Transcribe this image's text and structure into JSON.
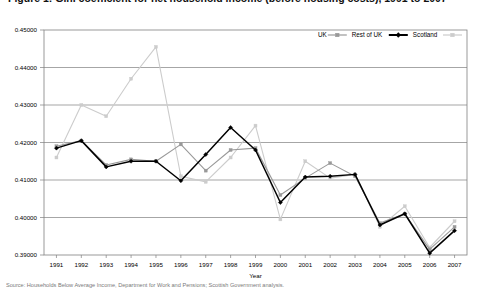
{
  "title": {
    "text": "Figure 1: Gini coefficient for net household income (before housing costs), 1991 to 2007",
    "cut_off": true
  },
  "footnote": {
    "text": "Source: Households Below Average Income, Department for Work and Pensions; Scottish Government analysis."
  },
  "legend": {
    "position": "top-right",
    "entries": [
      {
        "label": "UK",
        "color": "#999999",
        "marker": "square"
      },
      {
        "label": "Rest of UK",
        "color": "#000000",
        "marker": "diamond"
      },
      {
        "label": "Scotland",
        "color": "#cccccc",
        "marker": "square"
      }
    ]
  },
  "axes": {
    "xlabel": "Year",
    "ylabel": "",
    "ylim": [
      0.39,
      0.45
    ],
    "ytick_labels": [
      "0.45000",
      "0.44000",
      "0.43000",
      "0.42000",
      "0.41000",
      "0.40000",
      "0.39000"
    ],
    "ytick_values": [
      0.45,
      0.44,
      0.43,
      0.42,
      0.41,
      0.4,
      0.39
    ],
    "grid": true
  },
  "chart_data": {
    "type": "line",
    "title": "Figure 1: Gini coefficient for net household income (before housing costs), 1991 to 2007",
    "xlabel": "Year",
    "ylabel": "",
    "ylim": [
      0.39,
      0.45
    ],
    "grid": true,
    "legend_position": "top-right",
    "categories": [
      1991,
      1992,
      1993,
      1994,
      1995,
      1996,
      1997,
      1998,
      1999,
      2000,
      2001,
      2002,
      2003,
      2004,
      2005,
      2006,
      2007
    ],
    "x": [
      "1991",
      "1992",
      "1993",
      "1994",
      "1995",
      "1996",
      "1997",
      "1998",
      "1999",
      "2000",
      "2001",
      "2002",
      "2003",
      "2004",
      "2005",
      "2006",
      "2007"
    ],
    "series": [
      {
        "name": "UK",
        "color": "#999999",
        "marker": "square",
        "values": [
          0.419,
          0.4205,
          0.414,
          0.4155,
          0.415,
          0.4195,
          0.4125,
          0.418,
          0.4185,
          0.406,
          0.4105,
          0.4145,
          0.411,
          0.3985,
          0.401,
          0.3915,
          0.3975
        ]
      },
      {
        "name": "Rest of UK",
        "color": "#000000",
        "marker": "diamond",
        "values": [
          0.4185,
          0.4205,
          0.4135,
          0.415,
          0.415,
          0.4098,
          0.4168,
          0.424,
          0.418,
          0.404,
          0.4108,
          0.411,
          0.4115,
          0.398,
          0.401,
          0.3905,
          0.3965
        ]
      },
      {
        "name": "Scotland",
        "color": "#cccccc",
        "marker": "square",
        "values": [
          0.416,
          0.43,
          0.427,
          0.437,
          0.4455,
          0.411,
          0.4095,
          0.416,
          0.4245,
          0.3995,
          0.415,
          0.4105,
          0.4115,
          0.3975,
          0.403,
          0.392,
          0.399
        ]
      }
    ]
  }
}
